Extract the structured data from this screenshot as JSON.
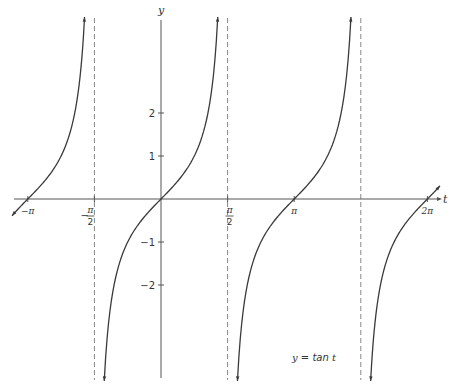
{
  "chart_data": {
    "type": "line",
    "title": "",
    "function": "y = tan t",
    "annotation": "y = tan t",
    "xlabel": "t",
    "ylabel": "y",
    "x_ticks": [
      {
        "value": -3.14159,
        "label": "−π",
        "frac": false
      },
      {
        "value": -1.5708,
        "label": "−π/2",
        "frac": true,
        "num": "π",
        "den": "2",
        "sign": "−"
      },
      {
        "value": 1.5708,
        "label": "π/2",
        "frac": true,
        "num": "π",
        "den": "2",
        "sign": ""
      },
      {
        "value": 3.14159,
        "label": "π",
        "frac": false
      },
      {
        "value": 6.28319,
        "label": "2π",
        "frac": false
      }
    ],
    "y_ticks": [
      {
        "value": 2,
        "label": "2"
      },
      {
        "value": 1,
        "label": "1"
      },
      {
        "value": -1,
        "label": "−1"
      },
      {
        "value": -2,
        "label": "−2"
      }
    ],
    "asymptotes": [
      -1.5708,
      1.5708,
      4.7124
    ],
    "xlim": [
      -3.5,
      6.6
    ],
    "ylim": [
      -4.2,
      4.2
    ],
    "grid": false,
    "legend": null,
    "series": [
      {
        "name": "tan t",
        "branch_centers": [
          -3.14159,
          0,
          3.14159,
          6.28319
        ]
      }
    ],
    "sample_points": [
      {
        "t": -3.14159,
        "y": 0
      },
      {
        "t": -0.7854,
        "y": -1
      },
      {
        "t": 0,
        "y": 0
      },
      {
        "t": 0.7854,
        "y": 1
      },
      {
        "t": 1.1071,
        "y": 2
      },
      {
        "t": 3.14159,
        "y": 0
      },
      {
        "t": 6.28319,
        "y": 0
      }
    ],
    "style": {
      "curve_color": "#3a3a3a",
      "axis_color": "#555555",
      "asymptote_color": "#777777",
      "asymptote_dash": "5,3"
    }
  },
  "layout": {
    "origin_px": [
      161,
      199
    ],
    "px_per_t": 42.4,
    "px_per_y": 43,
    "x_axis_px": [
      14,
      440
    ],
    "y_axis_px": [
      20,
      378
    ],
    "curve_y_clip_px": [
      17,
      381
    ],
    "curve_x_clip_px": [
      12,
      440
    ]
  }
}
